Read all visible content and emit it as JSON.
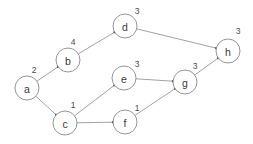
{
  "graph": {
    "title": "Directed weighted graph",
    "node_radius": 12,
    "colors": {
      "background": "#ffffff",
      "node_stroke": "#8a8a8a",
      "node_fill": "#ffffff",
      "edge_stroke": "#8a8a8a",
      "text": "#3a3a3a",
      "arrow": "#3a3a3a"
    },
    "nodes": [
      {
        "id": "a",
        "label": "a",
        "cx": 27,
        "cy": 88,
        "weight": "2",
        "wx": 34,
        "wy": 70
      },
      {
        "id": "b",
        "label": "b",
        "cx": 68,
        "cy": 60,
        "weight": "4",
        "wx": 73,
        "wy": 42
      },
      {
        "id": "c",
        "label": "c",
        "cx": 65,
        "cy": 123,
        "weight": "1",
        "wx": 73,
        "wy": 105
      },
      {
        "id": "d",
        "label": "d",
        "cx": 125,
        "cy": 26,
        "weight": "3",
        "wx": 137,
        "wy": 11
      },
      {
        "id": "e",
        "label": "e",
        "cx": 124,
        "cy": 78,
        "weight": "3",
        "wx": 137,
        "wy": 64
      },
      {
        "id": "f",
        "label": "f",
        "cx": 125,
        "cy": 122,
        "weight": "1",
        "wx": 137,
        "wy": 108
      },
      {
        "id": "g",
        "label": "g",
        "cx": 185,
        "cy": 82,
        "weight": "3",
        "wx": 195,
        "wy": 66
      },
      {
        "id": "h",
        "label": "h",
        "cx": 228,
        "cy": 51,
        "weight": "3",
        "wx": 238,
        "wy": 31
      }
    ],
    "edges": [
      {
        "id": "a-b",
        "from": "a",
        "to": "b"
      },
      {
        "id": "a-c",
        "from": "a",
        "to": "c"
      },
      {
        "id": "b-d",
        "from": "b",
        "to": "d"
      },
      {
        "id": "d-h",
        "from": "d",
        "to": "h"
      },
      {
        "id": "c-e",
        "from": "c",
        "to": "e"
      },
      {
        "id": "c-f",
        "from": "c",
        "to": "f"
      },
      {
        "id": "e-g",
        "from": "e",
        "to": "g"
      },
      {
        "id": "f-g",
        "from": "f",
        "to": "g"
      },
      {
        "id": "g-h",
        "from": "g",
        "to": "h"
      }
    ]
  }
}
